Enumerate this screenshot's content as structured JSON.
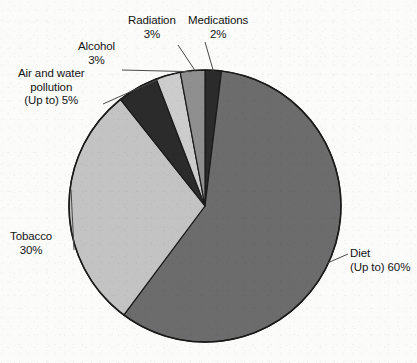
{
  "background_color": "#fbfbfa",
  "text_color": "#141414",
  "outline_color": "#1a1a1a",
  "leader_color": "#4a4a4a",
  "chart_data": {
    "type": "pie",
    "title": "",
    "subtitle": "",
    "xlabel": "",
    "ylabel": "",
    "legend_position": "none",
    "grid": false,
    "labels_outside": true,
    "start_angle_deg": 0,
    "direction": "clockwise",
    "categories": [
      "Medications",
      "Diet",
      "Tobacco",
      "Air and water pollution",
      "Alcohol",
      "Radiation"
    ],
    "values": [
      2,
      60,
      30,
      5,
      3,
      3
    ],
    "value_suffix": "%",
    "colors": [
      "#2b2b2b",
      "#6c6c6c",
      "#c3c3c3",
      "#2b2b2b",
      "#cccccc",
      "#8f8f8f"
    ],
    "slices": [
      {
        "name": "Medications",
        "value": 2,
        "label_line1": "Medications",
        "label_line2": "2%",
        "color": "#2b2b2b",
        "start_deg": 0,
        "end_deg": 7.2
      },
      {
        "name": "Diet",
        "value": 60,
        "label_line1": "Diet",
        "label_line2": "(Up to) 60%",
        "color": "#6c6c6c",
        "start_deg": 7.2,
        "end_deg": 223.2
      },
      {
        "name": "Tobacco",
        "value": 30,
        "label_line1": "Tobacco",
        "label_line2": "30%",
        "color": "#c3c3c3",
        "start_deg": 223.2,
        "end_deg": 331.2
      },
      {
        "name": "Air and water pollution",
        "value": 5,
        "label_line1": "Air and water",
        "label_line2": "pollution",
        "label_line3": "(Up to) 5%",
        "color": "#2b2b2b",
        "start_deg": 331.2,
        "end_deg": 349.2
      },
      {
        "name": "Alcohol",
        "value": 3,
        "label_line1": "Alcohol",
        "label_line2": "3%",
        "color": "#cccccc",
        "start_deg": 349.2,
        "end_deg": 360.0
      },
      {
        "name": "Radiation",
        "value": 3,
        "label_line1": "Radiation",
        "label_line2": "3%",
        "color": "#8f8f8f",
        "start_deg": 360.0,
        "end_deg": 370.8
      }
    ],
    "geometry": {
      "center_x": 205,
      "center_y": 206,
      "radius": 136
    }
  },
  "labels": {
    "medications": {
      "line1": "Medications",
      "line2": "2%"
    },
    "radiation": {
      "line1": "Radiation",
      "line2": "3%"
    },
    "alcohol": {
      "line1": "Alcohol",
      "line2": "3%"
    },
    "air_water_pollution": {
      "line1": "Air and water",
      "line2": "pollution",
      "line3": "(Up to) 5%"
    },
    "tobacco": {
      "line1": "Tobacco",
      "line2": "30%"
    },
    "diet": {
      "line1": "Diet",
      "line2": "(Up to) 60%"
    }
  }
}
